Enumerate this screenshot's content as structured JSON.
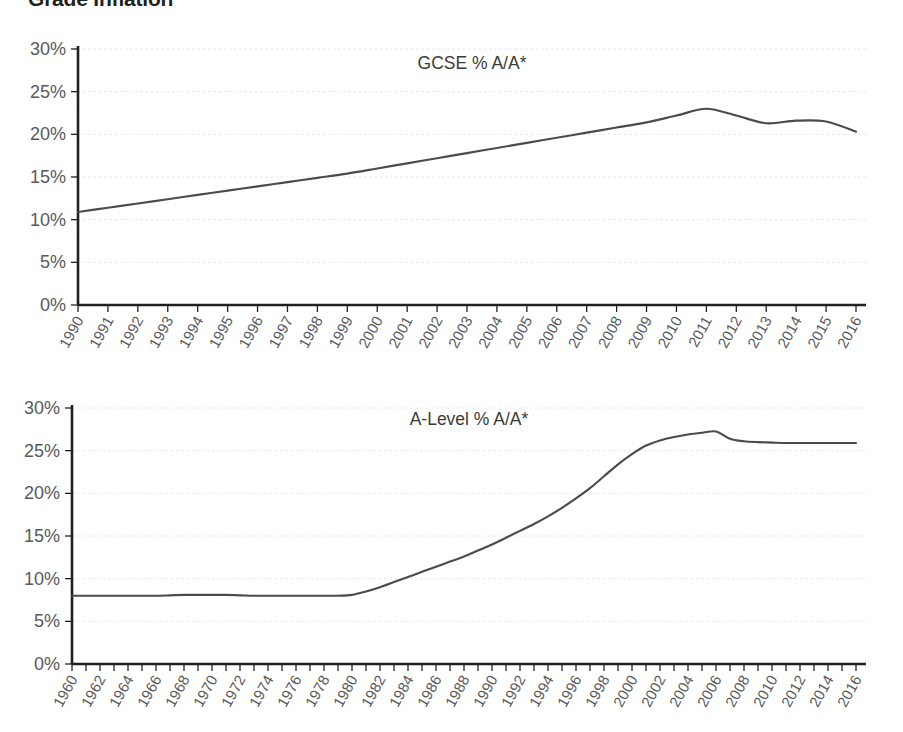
{
  "figure": {
    "title": "Grade Inflation"
  },
  "axis": {
    "y_tick_labels": [
      "30%",
      "25%",
      "20%",
      "15%",
      "10%",
      "5%",
      "0%"
    ],
    "y_tick_values": [
      30,
      25,
      20,
      15,
      10,
      5,
      0
    ]
  },
  "chart_data": [
    {
      "type": "line",
      "title": "GCSE % A/A*",
      "xlabel": "",
      "ylabel": "",
      "ylim": [
        0,
        30
      ],
      "xlim": [
        1990,
        2016
      ],
      "grid": true,
      "legend": "none",
      "y_ticks": [
        0,
        5,
        10,
        15,
        20,
        25,
        30
      ],
      "y_tick_labels": [
        "0%",
        "5%",
        "10%",
        "15%",
        "20%",
        "25%",
        "30%"
      ],
      "x_tick_labels": [
        "1990",
        "1991",
        "1992",
        "1993",
        "1994",
        "1995",
        "1996",
        "1997",
        "1998",
        "1999",
        "2000",
        "2001",
        "2002",
        "2003",
        "2004",
        "2005",
        "2006",
        "2007",
        "2008",
        "2009",
        "2010",
        "2011",
        "2012",
        "2013",
        "2014",
        "2015",
        "2016"
      ],
      "x": [
        1990,
        1991,
        1992,
        1993,
        1994,
        1995,
        1996,
        1997,
        1998,
        1999,
        2000,
        2001,
        2002,
        2003,
        2004,
        2005,
        2006,
        2007,
        2008,
        2009,
        2010,
        2011,
        2012,
        2013,
        2014,
        2015,
        2016
      ],
      "values": [
        10.9,
        11.4,
        11.9,
        12.4,
        12.9,
        13.4,
        13.9,
        14.4,
        14.9,
        15.4,
        16.0,
        16.6,
        17.2,
        17.8,
        18.4,
        19.0,
        19.6,
        20.2,
        20.8,
        21.4,
        22.2,
        23.0,
        22.2,
        21.3,
        21.6,
        21.5,
        20.3
      ],
      "series_color": "#4b4b4b"
    },
    {
      "type": "line",
      "title": "A-Level % A/A*",
      "xlabel": "",
      "ylabel": "",
      "ylim": [
        0,
        30
      ],
      "xlim": [
        1960,
        2016
      ],
      "grid": true,
      "legend": "none",
      "y_ticks": [
        0,
        5,
        10,
        15,
        20,
        25,
        30
      ],
      "y_tick_labels": [
        "0%",
        "5%",
        "10%",
        "15%",
        "20%",
        "25%",
        "30%"
      ],
      "x_tick_labels": [
        "1960",
        "1962",
        "1964",
        "1966",
        "1968",
        "1970",
        "1972",
        "1974",
        "1976",
        "1978",
        "1980",
        "1982",
        "1984",
        "1986",
        "1988",
        "1990",
        "1992",
        "1994",
        "1996",
        "1998",
        "2000",
        "2002",
        "2004",
        "2006",
        "2008",
        "2010",
        "2012",
        "2014",
        "2016"
      ],
      "x": [
        1960,
        1961,
        1962,
        1963,
        1964,
        1965,
        1966,
        1967,
        1968,
        1969,
        1970,
        1971,
        1972,
        1973,
        1974,
        1975,
        1976,
        1977,
        1978,
        1979,
        1980,
        1981,
        1982,
        1983,
        1984,
        1985,
        1986,
        1987,
        1988,
        1989,
        1990,
        1991,
        1992,
        1993,
        1994,
        1995,
        1996,
        1997,
        1998,
        1999,
        2000,
        2001,
        2002,
        2003,
        2004,
        2005,
        2006,
        2007,
        2008,
        2009,
        2010,
        2011,
        2012,
        2013,
        2014,
        2015,
        2016
      ],
      "values": [
        8.0,
        8.0,
        8.0,
        8.0,
        8.0,
        8.0,
        8.0,
        8.05,
        8.1,
        8.1,
        8.1,
        8.1,
        8.05,
        8.0,
        8.0,
        8.0,
        8.0,
        8.0,
        8.0,
        8.0,
        8.1,
        8.5,
        9.0,
        9.6,
        10.2,
        10.8,
        11.4,
        12.0,
        12.6,
        13.3,
        14.0,
        14.8,
        15.6,
        16.4,
        17.3,
        18.3,
        19.4,
        20.6,
        22.0,
        23.4,
        24.6,
        25.6,
        26.2,
        26.6,
        26.9,
        27.1,
        27.25,
        26.4,
        26.1,
        26.0,
        25.95,
        25.9,
        25.9,
        25.9,
        25.9,
        25.9,
        25.9
      ],
      "series_color": "#4b4b4b"
    }
  ]
}
